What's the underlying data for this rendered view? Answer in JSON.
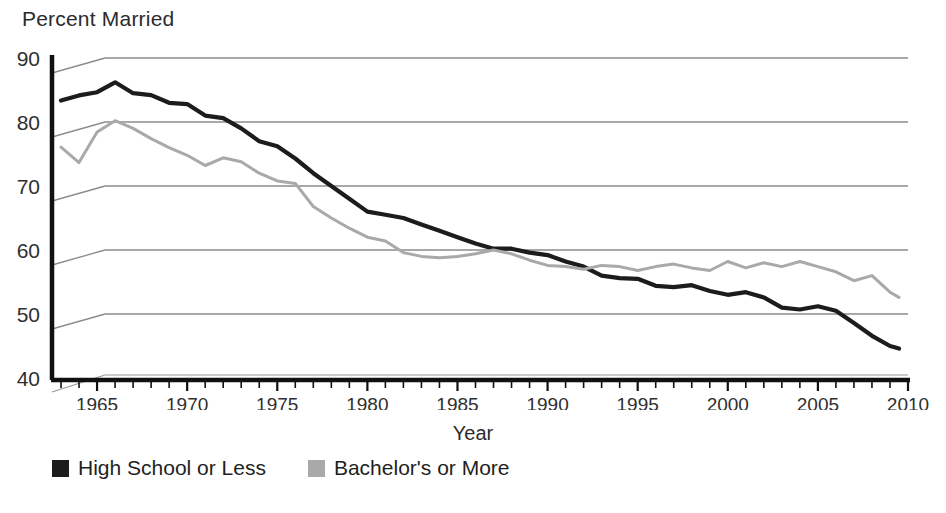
{
  "chart_data": {
    "type": "line",
    "title": "Percent Married",
    "xlabel": "Year",
    "ylabel": "",
    "ylim": [
      40,
      90
    ],
    "xlim": [
      1962.5,
      2010
    ],
    "yticks": [
      40,
      50,
      60,
      70,
      80,
      90
    ],
    "xticks": [
      1965,
      1970,
      1975,
      1980,
      1985,
      1990,
      1995,
      2000,
      2005,
      2010
    ],
    "xtick_minor_step": 1,
    "grid": "horizontal",
    "legend_position": "below-left",
    "colors": {
      "high_school_or_less": "#1c1c1c",
      "bachelors_or_more": "#a9a9a9",
      "gridline": "#8c8c8c",
      "axis": "#111111"
    },
    "series": [
      {
        "name": "High School or Less",
        "color": "#1c1c1c",
        "x": [
          1963,
          1964,
          1965,
          1966,
          1967,
          1968,
          1969,
          1970,
          1971,
          1972,
          1973,
          1974,
          1975,
          1976,
          1977,
          1978,
          1979,
          1980,
          1981,
          1982,
          1983,
          1984,
          1985,
          1986,
          1987,
          1988,
          1989,
          1990,
          1991,
          1992,
          1993,
          1994,
          1995,
          1996,
          1997,
          1998,
          1999,
          2000,
          2001,
          2002,
          2003,
          2004,
          2005,
          2006,
          2007,
          2008,
          2009,
          2009.5
        ],
        "values": [
          85.3,
          85.3,
          85.0,
          86.2,
          84.5,
          84.2,
          83.0,
          82.8,
          81.0,
          80.6,
          79.0,
          77.0,
          76.2,
          74.3,
          72.0,
          70.0,
          68.0,
          66.0,
          65.5,
          65.0,
          64.0,
          63.0,
          62.0,
          61.0,
          60.2,
          60.2,
          59.6,
          59.2,
          58.2,
          57.4,
          56.0,
          55.6,
          55.5,
          54.4,
          54.2,
          54.5,
          53.6,
          53.0,
          53.4,
          52.6,
          51.0,
          50.7,
          51.2,
          50.5,
          48.6,
          46.6,
          45.0,
          44.6
        ]
      },
      {
        "name": "Bachelor's or More",
        "color": "#a9a9a9",
        "x": [
          1963,
          1964,
          1965,
          1966,
          1967,
          1968,
          1969,
          1970,
          1971,
          1972,
          1973,
          1974,
          1975,
          1976,
          1977,
          1978,
          1979,
          1980,
          1981,
          1982,
          1983,
          1984,
          1985,
          1986,
          1987,
          1988,
          1989,
          1990,
          1991,
          1992,
          1993,
          1994,
          1995,
          1996,
          1997,
          1998,
          1999,
          2000,
          2001,
          2002,
          2003,
          2004,
          2005,
          2006,
          2007,
          2008,
          2009,
          2009.5
        ],
        "values": [
          78.0,
          74.8,
          78.8,
          80.2,
          79.0,
          77.4,
          76.0,
          74.8,
          73.2,
          74.4,
          73.8,
          72.0,
          70.8,
          70.4,
          66.8,
          65.0,
          63.4,
          62.0,
          61.4,
          59.6,
          59.0,
          58.8,
          59.0,
          59.4,
          60.0,
          59.4,
          58.4,
          57.6,
          57.4,
          57.0,
          57.6,
          57.4,
          56.8,
          57.4,
          57.8,
          57.2,
          56.8,
          58.2,
          57.2,
          58.0,
          57.4,
          58.2,
          57.4,
          56.6,
          55.2,
          56.0,
          53.4,
          52.6
        ]
      }
    ]
  },
  "legend": {
    "entries": [
      {
        "label": "High School or Less",
        "color": "#1c1c1c"
      },
      {
        "label": "Bachelor's or More",
        "color": "#a9a9a9"
      }
    ]
  }
}
